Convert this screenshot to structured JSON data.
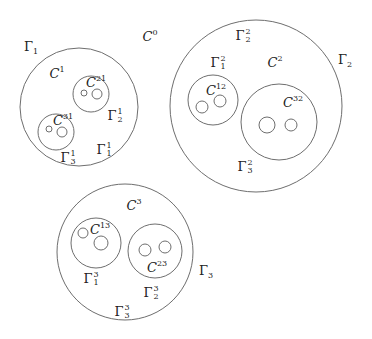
{
  "diagram": {
    "outer_region_label": {
      "base": "C",
      "sup": "0"
    },
    "components": [
      {
        "id": "1",
        "outer_boundary": {
          "base": "Γ",
          "sub": "1"
        },
        "region": {
          "base": "C",
          "sup": "1"
        },
        "holes": [
          {
            "region": {
              "base": "C",
              "sup": "21"
            },
            "boundary": {
              "base": "Γ",
              "sup": "1",
              "sub": "2"
            },
            "inner_holes": 2
          },
          {
            "region": {
              "base": "C",
              "sup": "31"
            },
            "boundary": {
              "base": "Γ",
              "sup": "1",
              "sub": "3"
            },
            "inner_holes": 2
          }
        ],
        "inner_boundary": {
          "base": "Γ",
          "sup": "1",
          "sub": "1"
        }
      },
      {
        "id": "2",
        "outer_boundary": {
          "base": "Γ",
          "sub": "2"
        },
        "region": {
          "base": "C",
          "sup": "2"
        },
        "holes": [
          {
            "region": {
              "base": "C",
              "sup": "12"
            },
            "boundary": {
              "base": "Γ",
              "sup": "2",
              "sub": "1"
            },
            "inner_holes": 2
          },
          {
            "region": {
              "base": "C",
              "sup": "32"
            },
            "boundary": {
              "base": "Γ",
              "sup": "2",
              "sub": "3"
            },
            "inner_holes": 2
          }
        ],
        "inner_boundary": {
          "base": "Γ",
          "sup": "2",
          "sub": "2"
        }
      },
      {
        "id": "3",
        "outer_boundary": {
          "base": "Γ",
          "sub": "3"
        },
        "region": {
          "base": "C",
          "sup": "3"
        },
        "holes": [
          {
            "region": {
              "base": "C",
              "sup": "13"
            },
            "boundary": {
              "base": "Γ",
              "sup": "3",
              "sub": "1"
            },
            "inner_holes": 2
          },
          {
            "region": {
              "base": "C",
              "sup": "23"
            },
            "boundary": {
              "base": "Γ",
              "sup": "3",
              "sub": "2"
            },
            "inner_holes": 2
          }
        ],
        "inner_boundary": {
          "base": "Γ",
          "sup": "3",
          "sub": "3"
        }
      }
    ]
  },
  "labels": {
    "C0": {
      "base": "C",
      "sup": "0"
    },
    "G1": {
      "base": "Γ",
      "sub": "1"
    },
    "C1": {
      "base": "C",
      "sup": "1"
    },
    "C21": {
      "base": "C",
      "sup": "21"
    },
    "G12": {
      "base": "Γ",
      "sup": "1",
      "sub": "2"
    },
    "C31": {
      "base": "C",
      "sup": "31"
    },
    "G13": {
      "base": "Γ",
      "sup": "1",
      "sub": "3"
    },
    "G11": {
      "base": "Γ",
      "sup": "1",
      "sub": "1"
    },
    "G22": {
      "base": "Γ",
      "sup": "2",
      "sub": "2"
    },
    "G21": {
      "base": "Γ",
      "sup": "2",
      "sub": "1"
    },
    "C2": {
      "base": "C",
      "sup": "2"
    },
    "G2": {
      "base": "Γ",
      "sub": "2"
    },
    "C12": {
      "base": "C",
      "sup": "12"
    },
    "C32": {
      "base": "C",
      "sup": "32"
    },
    "G23": {
      "base": "Γ",
      "sup": "2",
      "sub": "3"
    },
    "C3": {
      "base": "C",
      "sup": "3"
    },
    "C13": {
      "base": "C",
      "sup": "13"
    },
    "G31": {
      "base": "Γ",
      "sup": "3",
      "sub": "1"
    },
    "C23": {
      "base": "C",
      "sup": "23"
    },
    "G32": {
      "base": "Γ",
      "sup": "3",
      "sub": "2"
    },
    "G33": {
      "base": "Γ",
      "sup": "3",
      "sub": "3"
    },
    "G3": {
      "base": "Γ",
      "sub": "3"
    }
  },
  "colors": {
    "stroke": "#6e6e6e",
    "text": "#222222",
    "background": "#ffffff"
  }
}
